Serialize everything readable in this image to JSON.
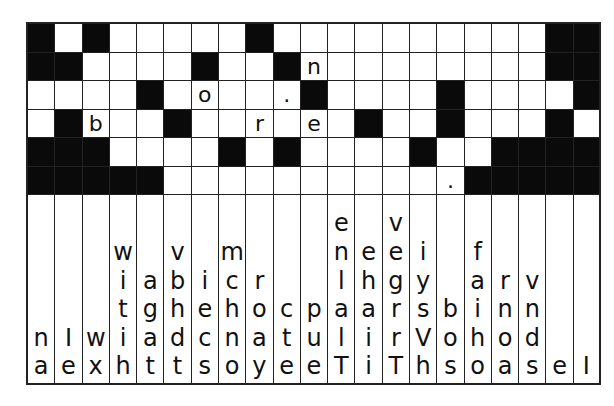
{
  "puzzle": {
    "type": "fallen-phrase",
    "columns": 21,
    "rows": 6,
    "grid": [
      [
        "#",
        "",
        "#",
        "",
        "",
        "",
        "",
        "",
        "#",
        "",
        "",
        "",
        "",
        "",
        "",
        "",
        "",
        "",
        "",
        "#",
        "#"
      ],
      [
        "#",
        "#",
        "",
        "",
        "",
        "",
        "#",
        "",
        "",
        "#",
        "n",
        "",
        "",
        "",
        "",
        "",
        "",
        "",
        "",
        "#",
        "#"
      ],
      [
        "",
        "",
        "",
        "",
        "#",
        "",
        "o",
        "",
        "",
        ".",
        "#",
        "",
        "",
        "",
        "",
        "#",
        "",
        "",
        "",
        "",
        "#"
      ],
      [
        "",
        "#",
        "b",
        "",
        "",
        "#",
        "",
        "",
        "r",
        "",
        "e",
        "",
        "#",
        "",
        "",
        "#",
        "",
        "",
        "",
        "#",
        ""
      ],
      [
        "#",
        "#",
        "#",
        "",
        "",
        "",
        "",
        "#",
        "",
        "#",
        "",
        "",
        "",
        "",
        "#",
        "",
        "",
        "#",
        "#",
        "#",
        "#"
      ],
      [
        "#",
        "#",
        "#",
        "#",
        "#",
        "",
        "",
        "",
        "",
        "",
        "",
        "",
        "",
        "",
        "",
        ".",
        "#",
        "#",
        "#",
        "#",
        "#"
      ]
    ],
    "letter_columns": [
      [
        "n",
        "a"
      ],
      [
        "I",
        "e"
      ],
      [
        "w",
        "x"
      ],
      [
        "w",
        "i",
        "t",
        "i",
        "h"
      ],
      [
        "a",
        "g",
        "a",
        "t"
      ],
      [
        "v",
        "b",
        "h",
        "d",
        "t"
      ],
      [
        "i",
        "e",
        "c",
        "s"
      ],
      [
        "m",
        "c",
        "h",
        "n",
        "o"
      ],
      [
        "r",
        "o",
        "a",
        "y"
      ],
      [
        "c",
        "t",
        "e"
      ],
      [
        "p",
        "u",
        "e"
      ],
      [
        "e",
        "n",
        "l",
        "a",
        "l",
        "T"
      ],
      [
        "e",
        "h",
        "a",
        "i",
        "i"
      ],
      [
        "v",
        "e",
        "g",
        "r",
        "r",
        "T"
      ],
      [
        "i",
        "y",
        "s",
        "V",
        "h"
      ],
      [
        "b",
        "o",
        "s"
      ],
      [
        "f",
        "a",
        "i",
        "h",
        "o"
      ],
      [
        "r",
        "n",
        "o",
        "a"
      ],
      [
        "v",
        "n",
        "d",
        "s"
      ],
      [
        "e"
      ],
      [
        "I"
      ]
    ]
  }
}
